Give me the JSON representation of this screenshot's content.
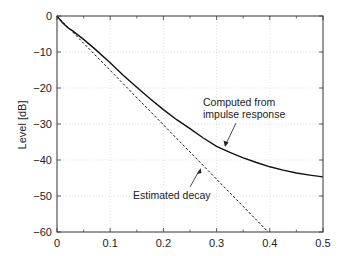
{
  "chart_data": {
    "type": "line",
    "title": "",
    "xlabel": "",
    "ylabel": "Level [dB]",
    "xlim": [
      0,
      0.5
    ],
    "ylim": [
      -60,
      0
    ],
    "grid": true,
    "legend": null,
    "x_ticks": [
      0,
      0.1,
      0.2,
      0.3,
      0.4,
      0.5
    ],
    "x_tick_labels": [
      "0",
      "0.1",
      "0.2",
      "0.3",
      "0.4",
      "0.5"
    ],
    "y_ticks": [
      0,
      -10,
      -20,
      -30,
      -40,
      -50,
      -60
    ],
    "y_tick_labels": [
      "0",
      "−10",
      "−20",
      "−30",
      "−40",
      "−50",
      "−60"
    ],
    "series": [
      {
        "name": "Computed from impulse response",
        "style": "solid",
        "color": "#111111",
        "x": [
          0,
          0.01,
          0.02,
          0.03,
          0.05,
          0.07,
          0.1,
          0.125,
          0.15,
          0.175,
          0.2,
          0.225,
          0.25,
          0.275,
          0.3,
          0.325,
          0.35,
          0.375,
          0.4,
          0.425,
          0.45,
          0.475,
          0.5
        ],
        "values": [
          0,
          -1.8,
          -3.2,
          -4.2,
          -6.5,
          -9.0,
          -13.0,
          -16.5,
          -19.8,
          -23.0,
          -26.0,
          -28.8,
          -31.3,
          -33.9,
          -36.2,
          -37.9,
          -39.4,
          -40.7,
          -41.9,
          -42.8,
          -43.6,
          -44.2,
          -44.7
        ]
      },
      {
        "name": "Estimated decay",
        "style": "dashed",
        "color": "#111111",
        "x": [
          0,
          0.397
        ],
        "values": [
          0,
          -60
        ]
      }
    ],
    "annotations": [
      {
        "text": [
          "Computed from",
          "impulse response"
        ],
        "arrow_to": [
          0.31,
          -36.5
        ]
      },
      {
        "text": [
          "Estimated decay"
        ],
        "arrow_to": [
          0.27,
          -42.5
        ]
      }
    ]
  }
}
